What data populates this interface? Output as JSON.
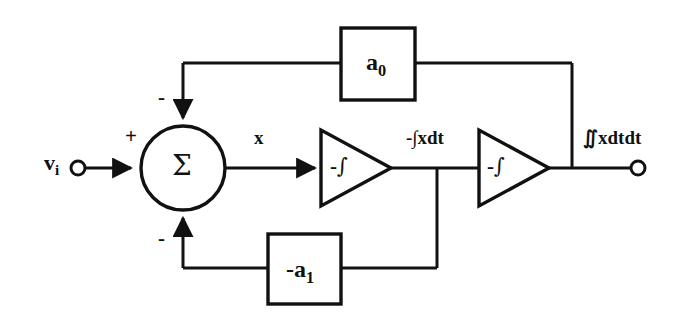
{
  "diagram": {
    "type": "control-system-block-diagram",
    "stroke_color": "#111111",
    "background_color": "#ffffff",
    "signals": {
      "input_label": "v",
      "input_subscript": "i",
      "sum_output_label": "x",
      "first_integrator_output_label": "-∫xdt",
      "second_integrator_output_label": "∬xdtdt"
    },
    "summing_junction": {
      "name": "summing-junction",
      "symbol": "Σ",
      "input_signs": {
        "from_input": "+",
        "from_a0_feedback": "-",
        "from_a1_feedback": "-"
      }
    },
    "blocks": [
      {
        "name": "gain-block-a0",
        "label": "a",
        "subscript": "0",
        "position": "top-feedback-path"
      },
      {
        "name": "gain-block-a1",
        "label": "-a",
        "subscript": "1",
        "position": "bottom-feedback-path"
      }
    ],
    "integrators": [
      {
        "name": "integrator-1",
        "label": "-",
        "symbol": "∫",
        "shape": "triangle"
      },
      {
        "name": "integrator-2",
        "label": "-",
        "symbol": "∫",
        "shape": "triangle"
      }
    ],
    "terminals": [
      {
        "name": "input-terminal",
        "kind": "open-circle"
      },
      {
        "name": "output-terminal",
        "kind": "open-circle"
      }
    ]
  }
}
